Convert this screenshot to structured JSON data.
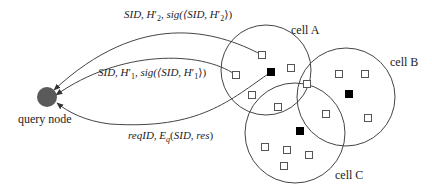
{
  "diagram": {
    "type": "network-query-flow",
    "query_node": {
      "label": "query node",
      "color": "#555555"
    },
    "cells": [
      {
        "id": "A",
        "label": "cell A"
      },
      {
        "id": "B",
        "label": "cell B"
      },
      {
        "id": "C",
        "label": "cell C"
      }
    ],
    "messages": [
      {
        "id": "msg-h2",
        "label": "SID, H′₂, sig(⟨SID, H′₂⟩)",
        "direction": "cell A node → query node"
      },
      {
        "id": "msg-h1",
        "label": "SID, H′₁, sig(⟨SID, H′₁⟩)",
        "direction": "cell A node → query node"
      },
      {
        "id": "msg-req",
        "label": "reqID, E_q(SID, res)",
        "direction": "query node → cell A leader"
      }
    ],
    "legend_implied": {
      "open_square": "sensor node",
      "filled_square": "cell leader / responding node"
    }
  },
  "labels": {
    "cell_a": "cell A",
    "cell_b": "cell B",
    "cell_c": "cell C",
    "query_node": "query node"
  },
  "colors": {
    "stroke": "#444444",
    "query_node_fill": "#5a5a5a",
    "filled_node": "#000000"
  }
}
